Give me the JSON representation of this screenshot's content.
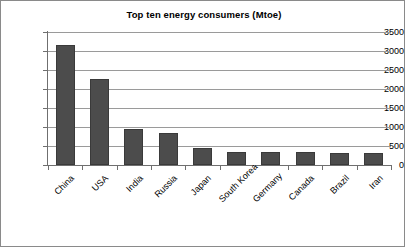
{
  "chart_data": {
    "type": "bar",
    "title": "Top ten energy consumers (Mtoe)",
    "xlabel": "",
    "ylabel": "",
    "categories": [
      "China",
      "USA",
      "India",
      "Russia",
      "Japan",
      "South Korea",
      "Germany",
      "Canada",
      "Brazil",
      "Iran"
    ],
    "values": [
      3150,
      2270,
      950,
      830,
      450,
      330,
      330,
      330,
      320,
      310
    ],
    "ylim": [
      0,
      3500
    ],
    "ytick_values": [
      0,
      500,
      1000,
      1500,
      2000,
      2500,
      3000,
      3500
    ],
    "ytick_labels": [
      "0",
      "500",
      "1000",
      "1500",
      "2000",
      "2500",
      "3000",
      "3500"
    ],
    "grid": true,
    "legend": false,
    "series_name": "Energy consumption (Mtoe)",
    "bar_color": "#4c4c4c",
    "gridline_color": "#9a9a9a",
    "axis_color": "#6f6f6f",
    "background_color": "#ffffff",
    "label_rotation": -45
  }
}
